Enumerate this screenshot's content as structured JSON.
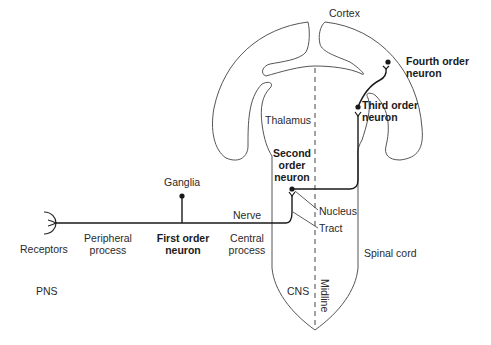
{
  "diagram": {
    "regions": {
      "cortex": "Cortex",
      "thalamus": "Thalamus",
      "spinal_cord": "Spinal cord",
      "cns": "CNS",
      "pns": "PNS",
      "midline": "Midline"
    },
    "neurons": {
      "first": {
        "line1": "First order",
        "line2": "neuron"
      },
      "second": {
        "line1": "Second",
        "line2": "order",
        "line3": "neuron"
      },
      "third": {
        "line1": "Third order",
        "line2": "neuron"
      },
      "fourth": {
        "line1": "Fourth order",
        "line2": "neuron"
      }
    },
    "parts": {
      "receptors": "Receptors",
      "peripheral_process": {
        "line1": "Peripheral",
        "line2": "process"
      },
      "central_process": {
        "line1": "Central",
        "line2": "process"
      },
      "ganglia": "Ganglia",
      "nerve": "Nerve",
      "nucleus": "Nucleus",
      "tract": "Tract"
    },
    "colors": {
      "outline": "#555555",
      "pathway": "#1a1a1a",
      "text": "#2a2a2a"
    }
  }
}
